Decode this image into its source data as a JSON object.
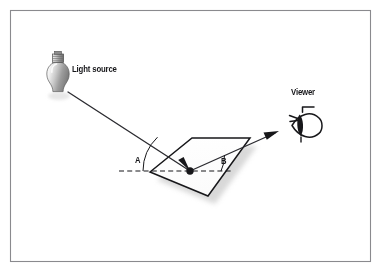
{
  "figure": {
    "background_color": "#ffffff",
    "border_color": "#8a8a8e",
    "ink_color": "#17171a"
  },
  "labels": {
    "light_source": "Light source",
    "viewer": "Viewer",
    "angle_incidence": "A",
    "angle_reflection": "B"
  },
  "icons": {
    "bulb": "light-bulb-icon",
    "eye": "eye-icon",
    "incident_arrow": "incident-ray-arrow-icon",
    "reflected_arrow": "reflected-ray-arrow-icon",
    "reflection_point": "reflection-point-dot"
  },
  "diagram_data": {
    "type": "diagram",
    "subject": "light reflection off a flat surface",
    "elements": [
      {
        "name": "light-source",
        "label": "Light source",
        "shape": "light bulb",
        "position": [
          58,
          80
        ]
      },
      {
        "name": "incident-ray",
        "from": [
          68,
          92
        ],
        "to": [
          190,
          171
        ],
        "style": "solid line",
        "arrow": "at surface"
      },
      {
        "name": "reflecting-surface",
        "shape": "parallelogram",
        "corners": [
          [
            150,
            172
          ],
          [
            192,
            138
          ],
          [
            250,
            138
          ],
          [
            208,
            196
          ]
        ],
        "fill": "#ffffff",
        "stroke": "#17171a",
        "shadow": true
      },
      {
        "name": "surface-normal-reference",
        "shape": "dashed horizontal line",
        "from": [
          120,
          171
        ],
        "to": [
          232,
          171
        ]
      },
      {
        "name": "reflection-point",
        "shape": "filled dot",
        "position": [
          190,
          171
        ]
      },
      {
        "name": "angle-of-incidence",
        "label": "A",
        "arc_center": [
          190,
          171
        ],
        "between": [
          "incident-ray",
          "dashed-reference-line"
        ]
      },
      {
        "name": "angle-of-reflection",
        "label": "B",
        "arc_center": [
          190,
          171
        ],
        "between": [
          "reflected-ray",
          "dashed-reference-line"
        ]
      },
      {
        "name": "reflected-ray",
        "from": [
          190,
          171
        ],
        "to": [
          276,
          132
        ],
        "style": "solid line",
        "arrow": "at viewer end"
      },
      {
        "name": "viewer",
        "label": "Viewer",
        "shape": "eye",
        "position": [
          305,
          125
        ]
      }
    ],
    "annotations": [
      "Angle A (incidence) equals angle B (reflection)."
    ]
  }
}
